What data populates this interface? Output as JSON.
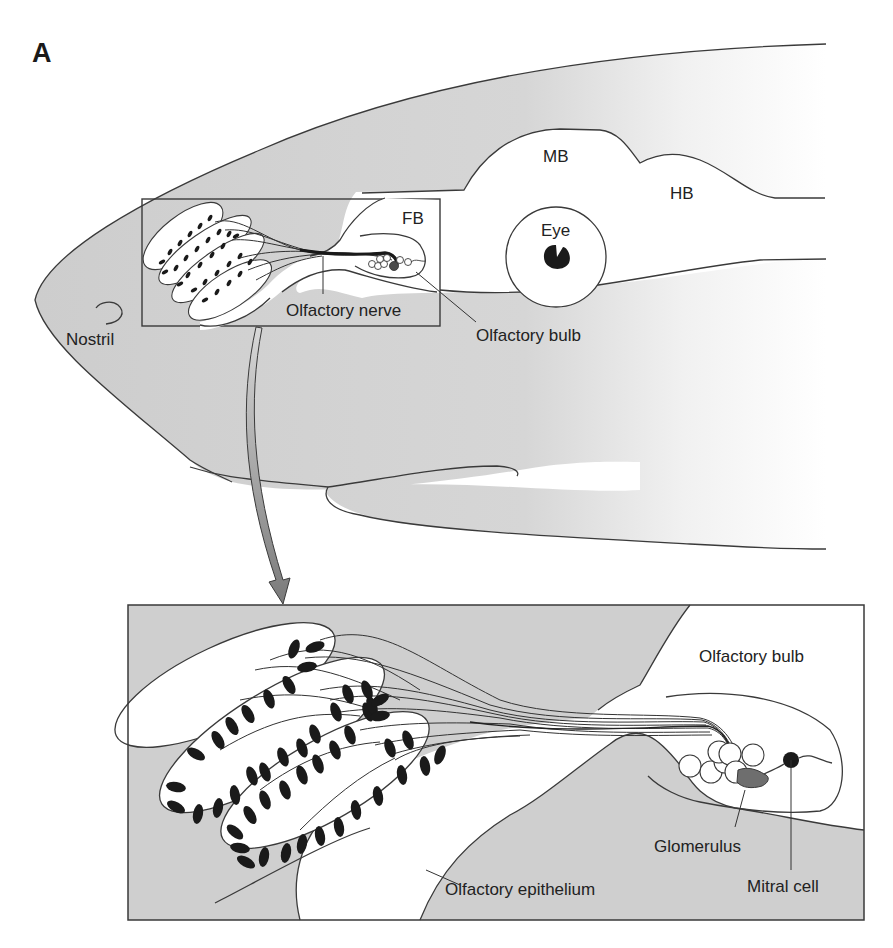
{
  "figure": {
    "panel_label": "A",
    "colors": {
      "tissue_grey": "#cfcfcf",
      "outline": "#3a3a3a",
      "neuron_fill": "#1a1a1a",
      "glomerulus_fill": "#6e6e6e",
      "arrow_fill": "#8a8a8a"
    },
    "overview": {
      "labels": {
        "mb": "MB",
        "hb": "HB",
        "fb": "FB",
        "eye": "Eye",
        "nostril": "Nostril",
        "olfactory_nerve": "Olfactory nerve",
        "olfactory_bulb": "Olfactory bulb"
      }
    },
    "inset": {
      "labels": {
        "olfactory_bulb": "Olfactory bulb",
        "glomerulus": "Glomerulus",
        "mitral_cell": "Mitral cell",
        "olfactory_epithelium": "Olfactory epithelium"
      }
    }
  }
}
